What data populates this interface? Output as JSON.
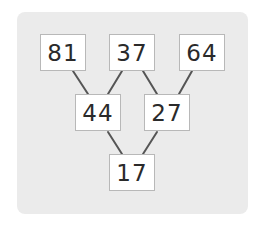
{
  "diagram": {
    "type": "number-pyramid",
    "rows": [
      [
        "81",
        "37",
        "64"
      ],
      [
        "44",
        "27"
      ],
      [
        "17"
      ]
    ],
    "nodes": {
      "top_left": "81",
      "top_middle": "37",
      "top_right": "64",
      "middle_left": "44",
      "middle_right": "27",
      "bottom": "17"
    },
    "edges": [
      [
        "81",
        "44"
      ],
      [
        "37",
        "44"
      ],
      [
        "37",
        "27"
      ],
      [
        "64",
        "27"
      ],
      [
        "44",
        "17"
      ],
      [
        "27",
        "17"
      ]
    ],
    "colors": {
      "panel_background": "#ebebeb",
      "box_background": "#ffffff",
      "box_border": "#b8b8b8",
      "line": "#555555",
      "text": "#2a2a2a"
    }
  }
}
